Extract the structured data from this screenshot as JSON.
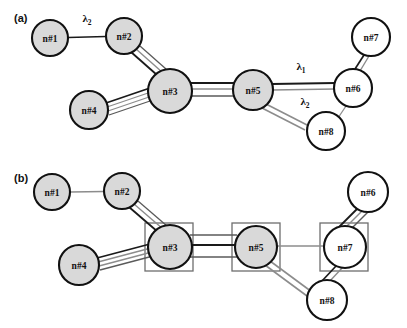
{
  "figure": {
    "background_color": "#ffffff",
    "width": 407,
    "height": 328,
    "node_fill_shaded": "#d9d9d9",
    "node_fill_white": "#ffffff",
    "node_stroke": "#111111",
    "edge_dark_color": "#1a1a1a",
    "edge_gray_color": "#8c8c8c",
    "box_stroke": "#6e6e6e"
  },
  "panels": [
    {
      "id": "a",
      "label": "(a)",
      "nodes": [
        {
          "id": "n1",
          "label": "n#1",
          "cx": 50,
          "cy": 38,
          "r": 18,
          "fill": "#d9d9d9"
        },
        {
          "id": "n2",
          "label": "n#2",
          "cx": 124,
          "cy": 36,
          "r": 18,
          "fill": "#d9d9d9"
        },
        {
          "id": "n3",
          "label": "n#3",
          "cx": 170,
          "cy": 91,
          "r": 22,
          "fill": "#d9d9d9"
        },
        {
          "id": "n4",
          "label": "n#4",
          "cx": 89,
          "cy": 110,
          "r": 19,
          "fill": "#d9d9d9"
        },
        {
          "id": "n5",
          "label": "n#5",
          "cx": 253,
          "cy": 90,
          "r": 20,
          "fill": "#d9d9d9"
        },
        {
          "id": "n6",
          "label": "n#6",
          "cx": 353,
          "cy": 88,
          "r": 19,
          "fill": "#ffffff"
        },
        {
          "id": "n7",
          "label": "n#7",
          "cx": 371,
          "cy": 37,
          "r": 19,
          "fill": "#ffffff"
        },
        {
          "id": "n8",
          "label": "n#8",
          "cx": 326,
          "cy": 131,
          "r": 19,
          "fill": "#ffffff"
        }
      ],
      "edges": [
        {
          "from": "n1",
          "to": "n2",
          "lines": 1,
          "style": "dark",
          "label": "λ2"
        },
        {
          "from": "n2",
          "to": "n3",
          "lines": 3,
          "style": "mixed",
          "label": ""
        },
        {
          "from": "n4",
          "to": "n3",
          "lines": 4,
          "style": "mixed",
          "label": ""
        },
        {
          "from": "n3",
          "to": "n5",
          "lines": 3,
          "style": "mixed",
          "label": ""
        },
        {
          "from": "n5",
          "to": "n6",
          "lines": 2,
          "style": "mixed",
          "label": "λ1"
        },
        {
          "from": "n5",
          "to": "n8",
          "lines": 2,
          "style": "gray",
          "label": "λ2"
        },
        {
          "from": "n8",
          "to": "n6",
          "lines": 1,
          "style": "gray",
          "label": ""
        },
        {
          "from": "n6",
          "to": "n7",
          "lines": 2,
          "style": "mixed",
          "label": ""
        }
      ],
      "edge_labels": [
        {
          "text": "λ",
          "sub": "2",
          "x": 87,
          "y": 21
        },
        {
          "text": "λ",
          "sub": "1",
          "x": 300,
          "y": 69
        },
        {
          "text": "λ",
          "sub": "2",
          "x": 304,
          "y": 104
        }
      ],
      "boxes": []
    },
    {
      "id": "b",
      "label": "(b)",
      "nodes": [
        {
          "id": "n1",
          "label": "n#1",
          "cx": 52,
          "cy": 192,
          "r": 18,
          "fill": "#d9d9d9"
        },
        {
          "id": "n2",
          "label": "n#2",
          "cx": 122,
          "cy": 191,
          "r": 18,
          "fill": "#d9d9d9"
        },
        {
          "id": "n3",
          "label": "n#3",
          "cx": 170,
          "cy": 247,
          "r": 22,
          "fill": "#d9d9d9"
        },
        {
          "id": "n4",
          "label": "n#4",
          "cx": 79,
          "cy": 265,
          "r": 20,
          "fill": "#d9d9d9"
        },
        {
          "id": "n5",
          "label": "n#5",
          "cx": 256,
          "cy": 247,
          "r": 21,
          "fill": "#d9d9d9"
        },
        {
          "id": "n7",
          "label": "n#7",
          "cx": 345,
          "cy": 247,
          "r": 21,
          "fill": "#ffffff"
        },
        {
          "id": "n6",
          "label": "n#6",
          "cx": 368,
          "cy": 192,
          "r": 20,
          "fill": "#ffffff"
        },
        {
          "id": "n8",
          "label": "n#8",
          "cx": 327,
          "cy": 300,
          "r": 20,
          "fill": "#ffffff"
        }
      ],
      "edges": [
        {
          "from": "n1",
          "to": "n2",
          "lines": 1,
          "style": "gray",
          "label": ""
        },
        {
          "from": "n2",
          "to": "n3",
          "lines": 3,
          "style": "mixed",
          "label": ""
        },
        {
          "from": "n4",
          "to": "n3",
          "lines": 4,
          "style": "mixed",
          "label": ""
        },
        {
          "from": "n3",
          "to": "n5",
          "lines": 3,
          "style": "mixed",
          "label": ""
        },
        {
          "from": "n5",
          "to": "n7",
          "lines": 1,
          "style": "gray",
          "label": ""
        },
        {
          "from": "n5",
          "to": "n8",
          "lines": 2,
          "style": "gray",
          "label": ""
        },
        {
          "from": "n8",
          "to": "n7",
          "lines": 2,
          "style": "mixed",
          "label": ""
        },
        {
          "from": "n7",
          "to": "n6",
          "lines": 3,
          "style": "mixed",
          "label": ""
        }
      ],
      "edge_labels": [],
      "boxes": [
        {
          "around": "n3",
          "x": 145,
          "y": 223,
          "w": 48,
          "h": 48
        },
        {
          "around": "n5",
          "x": 232,
          "y": 223,
          "w": 48,
          "h": 48
        },
        {
          "around": "n7",
          "x": 320,
          "y": 223,
          "w": 48,
          "h": 48
        }
      ]
    }
  ]
}
